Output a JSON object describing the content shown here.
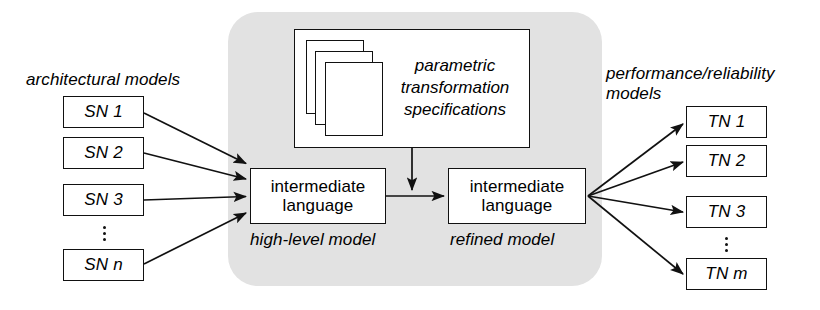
{
  "figure": {
    "background_color": "#ffffff",
    "stroke_color": "#111111",
    "panel_color": "#e0e0e0"
  },
  "captions": {
    "left": "architectural models",
    "right": "performance/reliability\nmodels",
    "high_level": "high-level model",
    "refined": "refined model"
  },
  "source_nodes": [
    {
      "label": "SN 1"
    },
    {
      "label": "SN 2"
    },
    {
      "label": "SN 3"
    },
    {
      "label": "SN n"
    }
  ],
  "target_nodes": [
    {
      "label": "TN 1"
    },
    {
      "label": "TN 2"
    },
    {
      "label": "TN 3"
    },
    {
      "label": "TN m"
    }
  ],
  "spec_box": {
    "text": "parametric\ntransformation\nspecifications",
    "sheet_count": 3
  },
  "intermediate": {
    "left_label": "intermediate\nlanguage",
    "right_label": "intermediate\nlanguage"
  },
  "ellipsis": {
    "left": "⋮",
    "right": "⋮"
  }
}
